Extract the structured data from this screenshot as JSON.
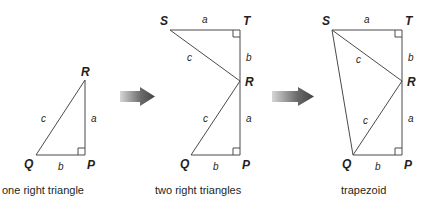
{
  "figures": [
    {
      "caption": "one right triangle",
      "vertices": {
        "R": "R",
        "Q": "Q",
        "P": "P"
      },
      "sides": {
        "c": "c",
        "a": "a",
        "b": "b"
      }
    },
    {
      "caption": "two right triangles",
      "vertices": {
        "S": "S",
        "T": "T",
        "R": "R",
        "Q": "Q",
        "P": "P"
      },
      "sides": {
        "top_a": "a",
        "upper_c": "c",
        "upper_b": "b",
        "lower_c": "c",
        "lower_a": "a",
        "bottom_b": "b"
      }
    },
    {
      "caption": "trapezoid",
      "vertices": {
        "S": "S",
        "T": "T",
        "R": "R",
        "Q": "Q",
        "P": "P"
      },
      "sides": {
        "top_a": "a",
        "upper_c": "c",
        "upper_b": "b",
        "lower_c": "c",
        "lower_a": "a",
        "bottom_b": "b"
      }
    }
  ],
  "colors": {
    "line": "#4a4a4a",
    "text": "#231f20",
    "arrow_dark": "#4d4d4d",
    "arrow_light": "#cfcfcf"
  }
}
